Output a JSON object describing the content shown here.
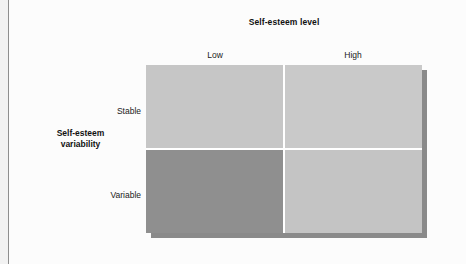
{
  "figure": {
    "column_axis_title": "Self-esteem level",
    "row_axis_title_line1": "Self-esteem",
    "row_axis_title_line2": "variability",
    "column_labels": [
      "Low",
      "High"
    ],
    "row_labels": [
      "Stable",
      "Variable"
    ]
  },
  "chart_data": {
    "type": "heatmap",
    "title": "",
    "xlabel": "Self-esteem level",
    "ylabel": "Self-esteem variability",
    "categories_x": [
      "Low",
      "High"
    ],
    "categories_y": [
      "Stable",
      "Variable"
    ],
    "grid": true,
    "legend": "none",
    "cells": [
      {
        "row": "Stable",
        "col": "Low",
        "shade": "light",
        "color": "#c6c6c6"
      },
      {
        "row": "Stable",
        "col": "High",
        "shade": "light",
        "color": "#c9c9c9"
      },
      {
        "row": "Variable",
        "col": "Low",
        "shade": "dark",
        "color": "#8f8f8f"
      },
      {
        "row": "Variable",
        "col": "High",
        "shade": "light",
        "color": "#c4c4c4"
      }
    ],
    "values": [
      [
        1,
        1
      ],
      [
        2,
        1
      ]
    ],
    "annotations": []
  },
  "colors": {
    "cell_light": "#c6c6c6",
    "cell_light_alt": "#c9c9c9",
    "cell_light_alt2": "#c4c4c4",
    "cell_dark": "#8f8f8f",
    "divider": "#ffffff",
    "shadow": "#8a8a8a",
    "page": "#fcfcfc",
    "rule": "#8e8e8e",
    "text": "#111111"
  },
  "caption": {
    "clipped_text": ""
  }
}
